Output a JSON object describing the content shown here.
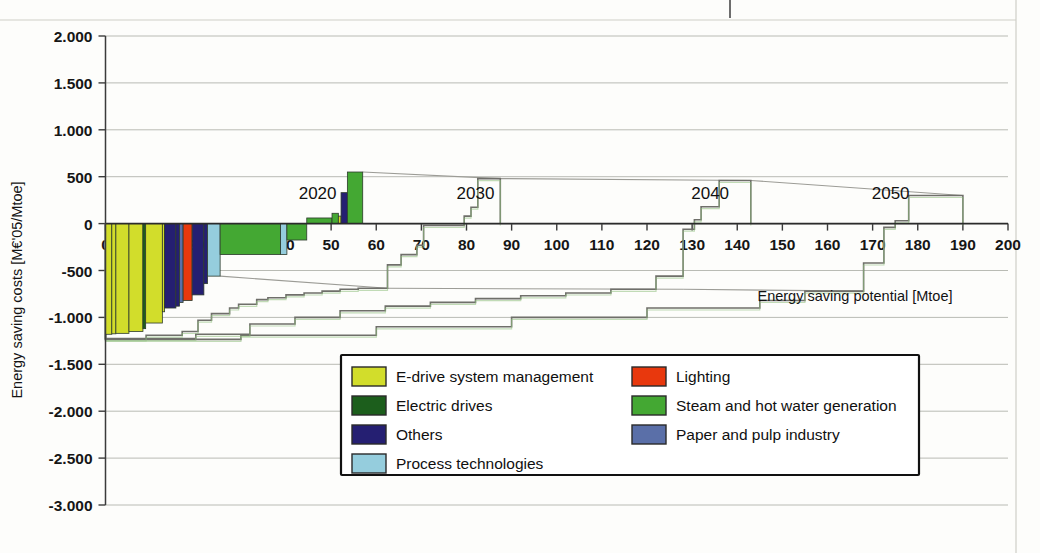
{
  "chart_data": {
    "type": "bar",
    "title": "",
    "subtitle": "",
    "xlabel": "Energy saving potential [Mtoe]",
    "ylabel": "Energy saving costs [M€'05/Mtoe]",
    "xlim": [
      0,
      200
    ],
    "ylim": [
      -3000,
      2000
    ],
    "xticks": [
      0,
      10,
      20,
      30,
      40,
      50,
      60,
      70,
      80,
      90,
      100,
      110,
      120,
      130,
      140,
      150,
      160,
      170,
      180,
      190,
      200
    ],
    "xtick_labels": [
      "0",
      "10",
      "20",
      "30",
      "40",
      "50",
      "60",
      "70",
      "80",
      "90",
      "100",
      "110",
      "120",
      "130",
      "140",
      "150",
      "160",
      "170",
      "180",
      "190",
      "200"
    ],
    "yticks": [
      2000,
      1500,
      1000,
      500,
      0,
      -500,
      -1000,
      -1500,
      -2000,
      -2500,
      -3000
    ],
    "ytick_labels": [
      "2.000",
      "1.500",
      "1.000",
      "500",
      "0",
      "-500",
      "-1.000",
      "-1.500",
      "-2.000",
      "-2.500",
      "-3.000"
    ],
    "grid": true,
    "legend_position": "inside-bottom-center",
    "annotations": [
      {
        "label": "2020",
        "x": 47,
        "y": 330
      },
      {
        "label": "2030",
        "x": 82,
        "y": 330
      },
      {
        "label": "2040",
        "x": 134,
        "y": 330
      },
      {
        "label": "2050",
        "x": 174,
        "y": 330
      }
    ],
    "legend": [
      {
        "label": "E-drive system management",
        "color": "#d2dd2b"
      },
      {
        "label": "Lighting",
        "color": "#e8380d"
      },
      {
        "label": "Electric drives",
        "color": "#1c5e1c"
      },
      {
        "label": "Steam and hot water generation",
        "color": "#44a833"
      },
      {
        "label": "Others",
        "color": "#251f72"
      },
      {
        "label": "Paper and pulp industry",
        "color": "#5a6fa8"
      },
      {
        "label": "Process technologies",
        "color": "#95cddd"
      }
    ],
    "series": [
      {
        "name": "2020",
        "style": "colored-bars",
        "bars": [
          {
            "x0": 0.0,
            "x1": 1.4,
            "cost": -1180,
            "category": "E-drive system management"
          },
          {
            "x0": 1.4,
            "x1": 2.3,
            "cost": -1175,
            "category": "E-drive system management"
          },
          {
            "x0": 2.3,
            "x1": 5.2,
            "cost": -1170,
            "category": "E-drive system management"
          },
          {
            "x0": 5.2,
            "x1": 8.3,
            "cost": -1150,
            "category": "E-drive system management"
          },
          {
            "x0": 8.3,
            "x1": 8.9,
            "cost": -1120,
            "category": "Electric drives"
          },
          {
            "x0": 8.9,
            "x1": 12.6,
            "cost": -1060,
            "category": "E-drive system management"
          },
          {
            "x0": 12.6,
            "x1": 13.1,
            "cost": -940,
            "category": "E-drive system management"
          },
          {
            "x0": 13.1,
            "x1": 15.6,
            "cost": -900,
            "category": "Others"
          },
          {
            "x0": 15.6,
            "x1": 16.4,
            "cost": -880,
            "category": "Others"
          },
          {
            "x0": 16.4,
            "x1": 17.2,
            "cost": -840,
            "category": "Paper and pulp industry"
          },
          {
            "x0": 17.2,
            "x1": 19.2,
            "cost": -820,
            "category": "Lighting"
          },
          {
            "x0": 19.2,
            "x1": 21.8,
            "cost": -760,
            "category": "Others"
          },
          {
            "x0": 21.8,
            "x1": 22.6,
            "cost": -640,
            "category": "Others"
          },
          {
            "x0": 22.6,
            "x1": 25.4,
            "cost": -560,
            "category": "Process technologies"
          },
          {
            "x0": 25.4,
            "x1": 38.8,
            "cost": -330,
            "category": "Steam and hot water generation"
          },
          {
            "x0": 38.8,
            "x1": 40.2,
            "cost": -330,
            "category": "Process technologies"
          },
          {
            "x0": 40.2,
            "x1": 44.6,
            "cost": -175,
            "category": "Steam and hot water generation"
          },
          {
            "x0": 44.6,
            "x1": 50.2,
            "cost": 60,
            "category": "Steam and hot water generation"
          },
          {
            "x0": 50.2,
            "x1": 51.6,
            "cost": 110,
            "category": "Steam and hot water generation"
          },
          {
            "x0": 51.6,
            "x1": 52.2,
            "cost": 80,
            "category": "E-drive system management"
          },
          {
            "x0": 52.2,
            "x1": 53.6,
            "cost": 330,
            "category": "Others"
          },
          {
            "x0": 53.6,
            "x1": 57.0,
            "cost": 550,
            "category": "Steam and hot water generation"
          }
        ]
      },
      {
        "name": "2030",
        "style": "outline",
        "steps": [
          {
            "x0": 0.0,
            "x1": 9.0,
            "cost": -1230
          },
          {
            "x0": 9.0,
            "x1": 17.0,
            "cost": -1190
          },
          {
            "x0": 17.0,
            "x1": 20.5,
            "cost": -1150
          },
          {
            "x0": 20.5,
            "x1": 23.5,
            "cost": -1030
          },
          {
            "x0": 23.5,
            "x1": 27.5,
            "cost": -960
          },
          {
            "x0": 27.5,
            "x1": 29.5,
            "cost": -900
          },
          {
            "x0": 29.5,
            "x1": 33.5,
            "cost": -860
          },
          {
            "x0": 33.5,
            "x1": 36.0,
            "cost": -810
          },
          {
            "x0": 36.0,
            "x1": 40.0,
            "cost": -790
          },
          {
            "x0": 40.0,
            "x1": 44.0,
            "cost": -760
          },
          {
            "x0": 44.0,
            "x1": 48.0,
            "cost": -740
          },
          {
            "x0": 48.0,
            "x1": 52.0,
            "cost": -720
          },
          {
            "x0": 52.0,
            "x1": 56.0,
            "cost": -700
          },
          {
            "x0": 56.0,
            "x1": 62.5,
            "cost": -690
          },
          {
            "x0": 62.5,
            "x1": 65.5,
            "cost": -440
          },
          {
            "x0": 65.5,
            "x1": 69.0,
            "cost": -330
          },
          {
            "x0": 69.0,
            "x1": 70.5,
            "cost": -230
          },
          {
            "x0": 70.5,
            "x1": 79.5,
            "cost": -20
          },
          {
            "x0": 79.5,
            "x1": 81.0,
            "cost": 80
          },
          {
            "x0": 81.0,
            "x1": 82.5,
            "cost": 175
          },
          {
            "x0": 82.5,
            "x1": 87.5,
            "cost": 480
          }
        ]
      },
      {
        "name": "2040",
        "style": "outline",
        "steps": [
          {
            "x0": 0.0,
            "x1": 20.0,
            "cost": -1225
          },
          {
            "x0": 20.0,
            "x1": 32.0,
            "cost": -1180
          },
          {
            "x0": 32.0,
            "x1": 42.0,
            "cost": -1070
          },
          {
            "x0": 42.0,
            "x1": 52.0,
            "cost": -1000
          },
          {
            "x0": 52.0,
            "x1": 62.0,
            "cost": -930
          },
          {
            "x0": 62.0,
            "x1": 72.0,
            "cost": -880
          },
          {
            "x0": 72.0,
            "x1": 82.0,
            "cost": -840
          },
          {
            "x0": 82.0,
            "x1": 92.0,
            "cost": -800
          },
          {
            "x0": 92.0,
            "x1": 102.0,
            "cost": -770
          },
          {
            "x0": 102.0,
            "x1": 112.0,
            "cost": -740
          },
          {
            "x0": 112.0,
            "x1": 122.0,
            "cost": -700
          },
          {
            "x0": 122.0,
            "x1": 128.0,
            "cost": -560
          },
          {
            "x0": 128.0,
            "x1": 130.5,
            "cost": -60
          },
          {
            "x0": 130.5,
            "x1": 132.0,
            "cost": 40
          },
          {
            "x0": 132.0,
            "x1": 136.0,
            "cost": 180
          },
          {
            "x0": 136.0,
            "x1": 143.0,
            "cost": 460
          }
        ]
      },
      {
        "name": "2050",
        "style": "outline",
        "steps": [
          {
            "x0": 0.0,
            "x1": 30.0,
            "cost": -1235
          },
          {
            "x0": 30.0,
            "x1": 60.0,
            "cost": -1190
          },
          {
            "x0": 60.0,
            "x1": 90.0,
            "cost": -1100
          },
          {
            "x0": 90.0,
            "x1": 120.0,
            "cost": -1000
          },
          {
            "x0": 120.0,
            "x1": 145.0,
            "cost": -900
          },
          {
            "x0": 145.0,
            "x1": 155.0,
            "cost": -820
          },
          {
            "x0": 155.0,
            "x1": 168.0,
            "cost": -720
          },
          {
            "x0": 168.0,
            "x1": 172.5,
            "cost": -420
          },
          {
            "x0": 172.5,
            "x1": 175.0,
            "cost": -40
          },
          {
            "x0": 175.0,
            "x1": 178.0,
            "cost": 30
          },
          {
            "x0": 178.0,
            "x1": 190.0,
            "cost": 300
          }
        ]
      }
    ]
  },
  "axes": {
    "ylabel": "Energy saving costs [M€'05/Mtoe]",
    "xlabel": "Energy saving potential [Mtoe]"
  },
  "legend": {
    "column_left": [
      {
        "label": "E-drive system management",
        "color": "#d2dd2b",
        "icon": "legend-swatch"
      },
      {
        "label": "Electric drives",
        "color": "#1c5e1c",
        "icon": "legend-swatch"
      },
      {
        "label": "Others",
        "color": "#251f72",
        "icon": "legend-swatch"
      },
      {
        "label": "Process technologies",
        "color": "#95cddd",
        "icon": "legend-swatch"
      }
    ],
    "column_right": [
      {
        "label": "Lighting",
        "color": "#e8380d",
        "icon": "legend-swatch"
      },
      {
        "label": "Steam and hot water generation",
        "color": "#44a833",
        "icon": "legend-swatch"
      },
      {
        "label": "Paper and pulp industry",
        "color": "#5a6fa8",
        "icon": "legend-swatch"
      }
    ]
  }
}
